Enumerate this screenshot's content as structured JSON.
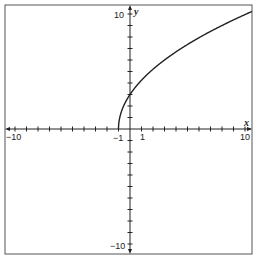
{
  "chart_data": {
    "type": "line",
    "title": "",
    "function": "y = 3*sqrt(x + 1)",
    "xlabel": "x",
    "ylabel": "y",
    "xlim": [
      -10.8,
      10.7
    ],
    "ylim": [
      -10.8,
      10.8
    ],
    "grid": false,
    "x_tick_labels": [
      {
        "value": -10,
        "label": "−10"
      },
      {
        "value": -1,
        "label": "−1"
      },
      {
        "value": 1,
        "label": "1"
      },
      {
        "value": 10,
        "label": "10"
      }
    ],
    "y_tick_labels": [
      {
        "value": 10,
        "label": "10"
      },
      {
        "value": -10,
        "label": "−10"
      }
    ],
    "tick_step": 1,
    "series": [
      {
        "name": "curve",
        "color": "#222222",
        "x": [
          -1,
          -0.9,
          -0.75,
          -0.5,
          0,
          0.5,
          1,
          2,
          3,
          4,
          5,
          6,
          7,
          8,
          9,
          10,
          10.6
        ],
        "values": [
          0,
          0.95,
          1.5,
          2.12,
          3,
          3.67,
          4.24,
          5.2,
          6,
          6.71,
          7.35,
          7.94,
          8.49,
          9,
          9.49,
          9.95,
          10.22
        ]
      }
    ]
  },
  "labels": {
    "x_axis": "x",
    "y_axis": "y",
    "x_neg10": "−10",
    "x_neg1": "−1",
    "x_1": "1",
    "x_10": "10",
    "y_10": "10",
    "y_neg10": "−10"
  },
  "colors": {
    "line": "#222222",
    "frame": "#444444",
    "background": "#ffffff"
  }
}
